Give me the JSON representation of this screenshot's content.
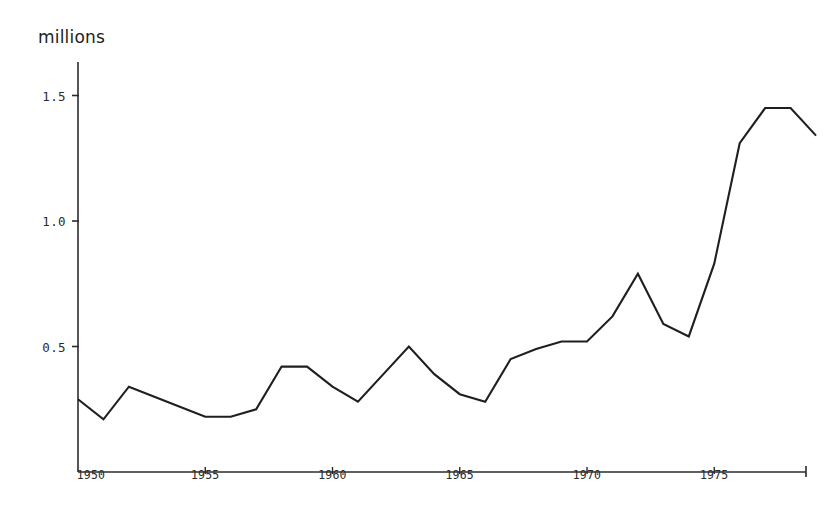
{
  "figure": {
    "background_color": "#ffffff",
    "line_color": "#1f1f1f",
    "axis_color": "#2b2b2b",
    "unit_label": "millions"
  },
  "axes": {
    "y_tick_labels": [
      "1.5",
      "1.0",
      "0.5"
    ],
    "y_tick_values": [
      1.5,
      1.0,
      0.5
    ],
    "x_tick_labels": [
      "1950",
      "1955",
      "1960",
      "1965",
      "1970",
      "1975"
    ],
    "x_tick_values": [
      1950,
      1955,
      1960,
      1965,
      1970,
      1975
    ]
  },
  "chart_data": {
    "type": "line",
    "title": "",
    "subtitle": "",
    "xlabel": "",
    "ylabel": "millions",
    "xlim": [
      1950,
      1978.6
    ],
    "ylim": [
      0,
      1.6
    ],
    "grid": false,
    "legend": null,
    "x": [
      1950,
      1951,
      1952,
      1953,
      1954,
      1955,
      1956,
      1957,
      1958,
      1959,
      1960,
      1961,
      1962,
      1963,
      1964,
      1965,
      1966,
      1967,
      1968,
      1969,
      1970,
      1971,
      1972,
      1973,
      1974,
      1975,
      1976,
      1977,
      1978,
      1979
    ],
    "values": [
      0.29,
      0.21,
      0.34,
      0.3,
      0.26,
      0.22,
      0.22,
      0.25,
      0.42,
      0.42,
      0.34,
      0.28,
      0.39,
      0.5,
      0.39,
      0.31,
      0.28,
      0.45,
      0.49,
      0.52,
      0.52,
      0.62,
      0.79,
      0.59,
      0.54,
      0.83,
      1.31,
      1.45,
      1.45,
      1.34
    ],
    "series": [
      {
        "name": "millions",
        "values": [
          0.29,
          0.21,
          0.34,
          0.3,
          0.26,
          0.22,
          0.22,
          0.25,
          0.42,
          0.42,
          0.34,
          0.28,
          0.39,
          0.5,
          0.39,
          0.31,
          0.28,
          0.45,
          0.49,
          0.52,
          0.52,
          0.62,
          0.79,
          0.59,
          0.54,
          0.83,
          1.31,
          1.45,
          1.45,
          1.34
        ]
      }
    ]
  }
}
